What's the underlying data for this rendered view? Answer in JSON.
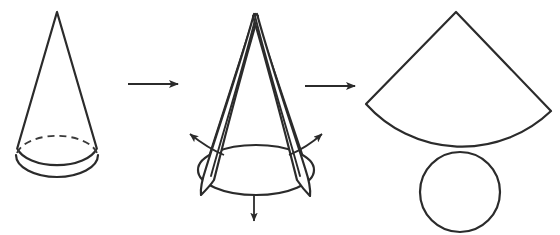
{
  "figure": {
    "background_color": "#ffffff",
    "stroke_color": "#2b2b2b",
    "width": 560,
    "height": 235,
    "step_count": 3,
    "arrow_count": 2
  },
  "steps": [
    {
      "index": 1,
      "name": "solid-cone",
      "label": "Cone",
      "description": "A right circular cone drawn in three-quarter view with a solid lower base arc and a dashed hidden upper base arc.",
      "apex": {
        "x": 57,
        "y": 12
      },
      "base_ellipse": {
        "cx": 57,
        "cy": 155,
        "rx": 41,
        "ry": 22
      },
      "base_hidden_arc_style": "dashed",
      "base_visible_arc_style": "solid"
    },
    {
      "index": 2,
      "name": "cone-unrolling",
      "label": "Cone being cut and unrolled",
      "description": "The lateral surface is slit along a slant line and the two edges peel outward; arrows show the base circle separating downward and the flaps opening left and right.",
      "apex": {
        "x": 255,
        "y": 14
      },
      "base_ellipse": {
        "cx": 256,
        "cy": 170,
        "rx": 58,
        "ry": 25
      },
      "motion_arrows": [
        {
          "name": "flap-left-arrow",
          "direction": "up-left",
          "from": {
            "x": 222,
            "y": 152
          },
          "to": {
            "x": 184,
            "y": 131
          }
        },
        {
          "name": "flap-right-arrow",
          "direction": "up-right",
          "from": {
            "x": 290,
            "y": 152
          },
          "to": {
            "x": 327,
            "y": 131
          }
        },
        {
          "name": "base-down-arrow",
          "direction": "down",
          "from": {
            "x": 254,
            "y": 194
          },
          "to": {
            "x": 254,
            "y": 228
          }
        }
      ]
    },
    {
      "index": 3,
      "name": "cone-net",
      "label": "Flattened net: circular sector and base circle",
      "description": "The unrolled lateral surface becomes a circular sector (fan) and the base becomes a separate circle tangent beneath it.",
      "sector": {
        "apex": {
          "x": 456,
          "y": 12
        },
        "radius": 140,
        "left_corner": {
          "x": 366,
          "y": 104
        },
        "right_corner": {
          "x": 551,
          "y": 111
        },
        "arc_bottom": {
          "x": 460,
          "y": 152
        }
      },
      "circle": {
        "cx": 460,
        "cy": 192,
        "r": 40
      }
    }
  ],
  "transition_arrows": [
    {
      "name": "transition-arrow-1",
      "label": "cone to unrolling",
      "from": {
        "x": 128,
        "y": 84
      },
      "to": {
        "x": 186,
        "y": 84
      }
    },
    {
      "name": "transition-arrow-2",
      "label": "unrolling to net",
      "from": {
        "x": 305,
        "y": 86
      },
      "to": {
        "x": 363,
        "y": 86
      }
    }
  ]
}
